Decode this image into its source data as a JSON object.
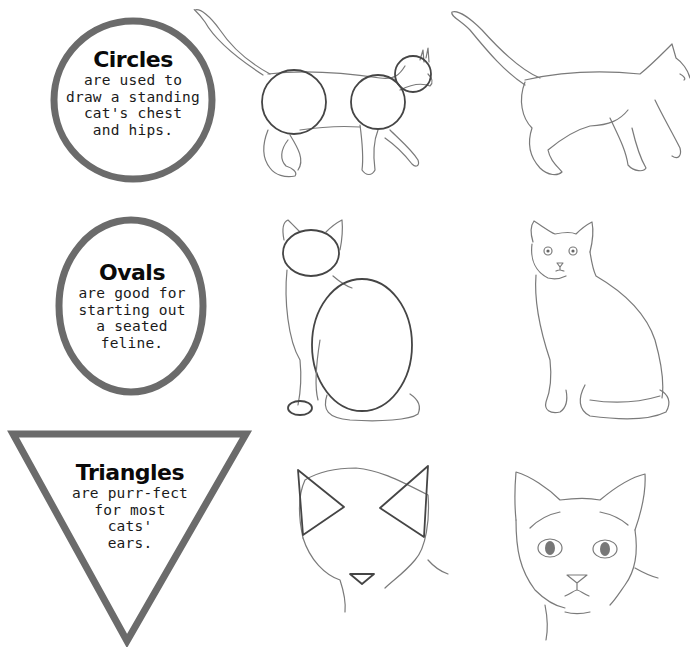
{
  "colors": {
    "shape_border": "#6b6b6b",
    "sketch_line": "#7a7a7a",
    "guide_line": "#454545",
    "background": "#ffffff"
  },
  "rows": [
    {
      "shape": "circle",
      "title": "Circles",
      "body": "are used to\ndraw a standing\ncat's chest\nand hips.",
      "guide_drawing": "standing-cat-with-circle-guides",
      "final_drawing": "standing-cat-finished"
    },
    {
      "shape": "oval",
      "title": "Ovals",
      "body": "are good for\nstarting out\na seated\nfeline.",
      "guide_drawing": "seated-cat-with-oval-guides",
      "final_drawing": "seated-cat-finished"
    },
    {
      "shape": "triangle",
      "title": "Triangles",
      "body": "are purr-fect\nfor most\ncats'\nears.",
      "guide_drawing": "cat-head-with-triangle-ear-guides",
      "final_drawing": "cat-head-finished"
    }
  ]
}
